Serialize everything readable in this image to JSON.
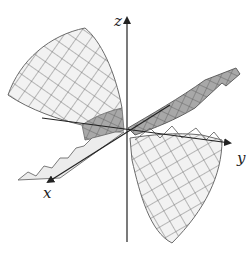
{
  "figure": {
    "type": "3d-surface",
    "axes": {
      "x_label": "x",
      "y_label": "y",
      "z_label": "z"
    },
    "colors": {
      "axis": "#222222",
      "mesh_line": "#6b6b6b",
      "surface_light": "#f2f2f2",
      "surface_shade": "#a8a8a8"
    }
  }
}
